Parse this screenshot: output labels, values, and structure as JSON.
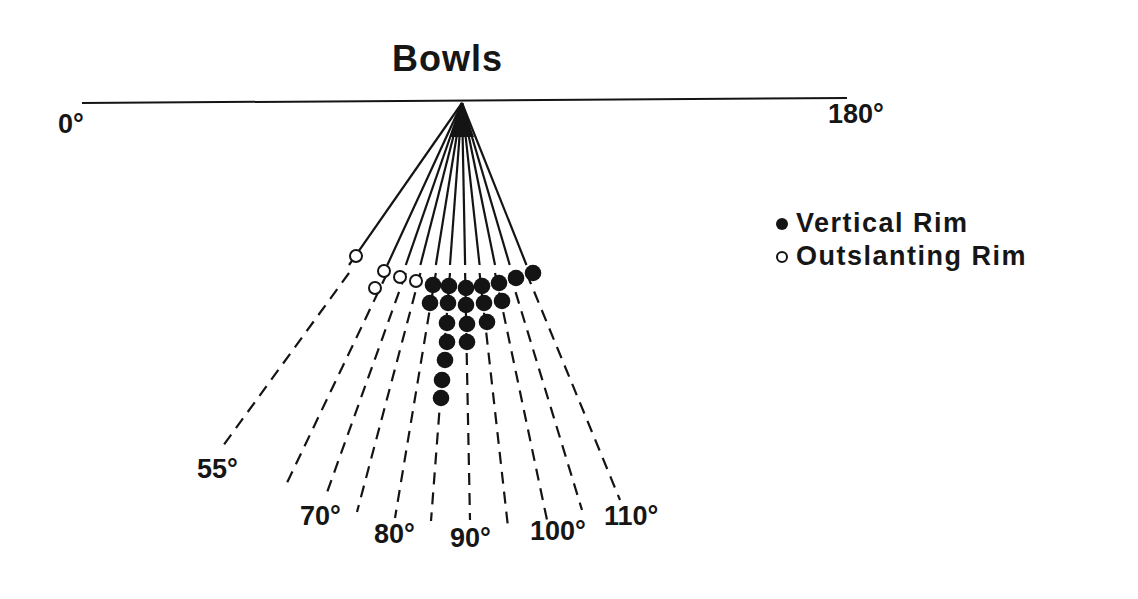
{
  "title": "Bowls",
  "baseline": {
    "left_label": "0°",
    "right_label": "180°"
  },
  "legend": {
    "items": [
      {
        "symbol": "filled-circle",
        "label": "Vertical Rim"
      },
      {
        "symbol": "open-circle",
        "label": "Outslanting Rim"
      }
    ]
  },
  "angle_labels": [
    {
      "text": "55°",
      "x": 197,
      "y": 456
    },
    {
      "text": "70°",
      "x": 300,
      "y": 503
    },
    {
      "text": "80°",
      "x": 374,
      "y": 521
    },
    {
      "text": "90°",
      "x": 450,
      "y": 525
    },
    {
      "text": "100°",
      "x": 530,
      "y": 518
    },
    {
      "text": "110°",
      "x": 604,
      "y": 503
    }
  ],
  "colors": {
    "ink": "#141414",
    "background": "#ffffff"
  },
  "chart_data": {
    "type": "scatter",
    "title": "Bowls",
    "axis": {
      "range": [
        0,
        180
      ],
      "ticks": [
        "0°",
        "180°"
      ],
      "ray_labels": [
        "55°",
        "70°",
        "80°",
        "90°",
        "100°",
        "110°"
      ]
    },
    "legend": [
      "Vertical Rim",
      "Outslanting Rim"
    ],
    "series": [
      {
        "name": "Vertical Rim",
        "marker": "filled",
        "points": [
          {
            "x": 433,
            "y": 285
          },
          {
            "x": 449,
            "y": 286
          },
          {
            "x": 466,
            "y": 288
          },
          {
            "x": 482,
            "y": 286
          },
          {
            "x": 499,
            "y": 283
          },
          {
            "x": 516,
            "y": 278
          },
          {
            "x": 533,
            "y": 273
          },
          {
            "x": 430,
            "y": 303
          },
          {
            "x": 448,
            "y": 303
          },
          {
            "x": 466,
            "y": 305
          },
          {
            "x": 484,
            "y": 303
          },
          {
            "x": 502,
            "y": 301
          },
          {
            "x": 447,
            "y": 323
          },
          {
            "x": 467,
            "y": 324
          },
          {
            "x": 487,
            "y": 322
          },
          {
            "x": 447,
            "y": 342
          },
          {
            "x": 467,
            "y": 342
          },
          {
            "x": 445,
            "y": 360
          },
          {
            "x": 442,
            "y": 380
          },
          {
            "x": 441,
            "y": 398
          }
        ],
        "count": 20
      },
      {
        "name": "Outslanting Rim",
        "marker": "open",
        "points": [
          {
            "x": 356,
            "y": 256
          },
          {
            "x": 384,
            "y": 271
          },
          {
            "x": 400,
            "y": 277
          },
          {
            "x": 416,
            "y": 281
          },
          {
            "x": 375,
            "y": 288
          }
        ],
        "count": 5
      }
    ],
    "rays": {
      "apex": {
        "x": 462,
        "y": 103
      },
      "solid_end_y": 265,
      "endpoints": [
        {
          "x": 220,
          "y": 450
        },
        {
          "x": 285,
          "y": 487
        },
        {
          "x": 325,
          "y": 498
        },
        {
          "x": 357,
          "y": 512
        },
        {
          "x": 395,
          "y": 518
        },
        {
          "x": 431,
          "y": 521
        },
        {
          "x": 470,
          "y": 520
        },
        {
          "x": 508,
          "y": 527
        },
        {
          "x": 547,
          "y": 520
        },
        {
          "x": 582,
          "y": 510
        },
        {
          "x": 620,
          "y": 500
        }
      ]
    }
  }
}
